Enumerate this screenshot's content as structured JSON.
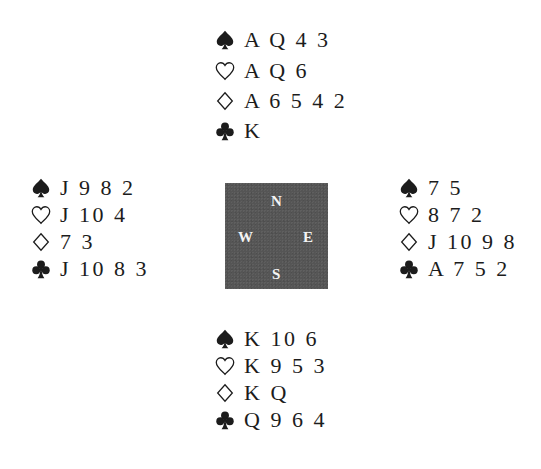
{
  "deal": {
    "north": {
      "spades": "A Q 4 3",
      "hearts": "A Q 6",
      "diamonds": "A 6 5 4 2",
      "clubs": "K"
    },
    "west": {
      "spades": "J 9 8 2",
      "hearts": "J 10 4",
      "diamonds": "7 3",
      "clubs": "J 10 8 3"
    },
    "east": {
      "spades": "7 5",
      "hearts": "8 7 2",
      "diamonds": "J 10 9 8",
      "clubs": "A 7 5 2"
    },
    "south": {
      "spades": "K 10 6",
      "hearts": "K 9 5 3",
      "diamonds": "K Q",
      "clubs": "Q 9 6 4"
    }
  },
  "compass": {
    "north": "N",
    "west": "W",
    "east": "E",
    "south": "S",
    "color": "#555555"
  },
  "icons": {
    "spades": "spade-icon",
    "hearts": "heart-outline-icon",
    "diamonds": "diamond-outline-icon",
    "clubs": "club-icon"
  }
}
